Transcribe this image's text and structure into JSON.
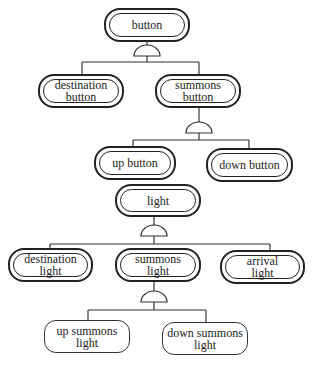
{
  "diagram": {
    "type": "feature-tree",
    "line_color": "#222222",
    "nodes": [
      {
        "id": "button",
        "label": "button",
        "style": "double"
      },
      {
        "id": "destination_button",
        "label": "destination\nbutton",
        "style": "double"
      },
      {
        "id": "summons_button",
        "label": "summons\nbutton",
        "style": "double"
      },
      {
        "id": "up_button",
        "label": "up button",
        "style": "double"
      },
      {
        "id": "down_button",
        "label": "down button",
        "style": "double"
      },
      {
        "id": "light",
        "label": "light",
        "style": "double"
      },
      {
        "id": "destination_light",
        "label": "destination\nlight",
        "style": "double"
      },
      {
        "id": "summons_light",
        "label": "summons\nlight",
        "style": "double"
      },
      {
        "id": "arrival_light",
        "label": "arrival\nlight",
        "style": "double"
      },
      {
        "id": "up_summons_light",
        "label": "up summons\nlight",
        "style": "single"
      },
      {
        "id": "down_summons_light",
        "label": "down summons\nlight",
        "style": "single"
      }
    ],
    "relations": [
      {
        "parent": "button",
        "type": "and",
        "children": [
          "destination_button",
          "summons_button"
        ]
      },
      {
        "parent": "summons_button",
        "type": "and",
        "children": [
          "up_button",
          "down_button"
        ]
      },
      {
        "parent": "light",
        "type": "and",
        "children": [
          "destination_light",
          "summons_light",
          "arrival_light"
        ]
      },
      {
        "parent": "summons_light",
        "type": "and",
        "children": [
          "up_summons_light",
          "down_summons_light"
        ]
      }
    ]
  }
}
